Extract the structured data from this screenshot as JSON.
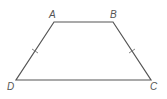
{
  "figure": {
    "type": "isosceles trapezoid",
    "vertices": [
      {
        "name": "A",
        "label": "A",
        "x": 54,
        "y": 22,
        "lx": 49,
        "ly": 18
      },
      {
        "name": "B",
        "label": "B",
        "x": 113,
        "y": 22,
        "lx": 110,
        "ly": 18
      },
      {
        "name": "C",
        "label": "C",
        "x": 151,
        "y": 80,
        "lx": 150,
        "ly": 90
      },
      {
        "name": "D",
        "label": "D",
        "x": 16,
        "y": 80,
        "lx": 7,
        "ly": 90
      }
    ],
    "congruent_sides": [
      "AD",
      "BC"
    ],
    "line_color": "#555555"
  }
}
